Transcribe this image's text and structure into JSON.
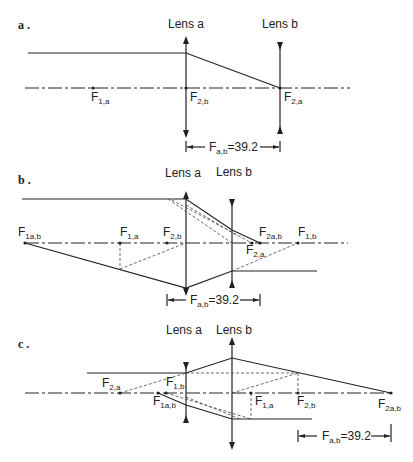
{
  "panels": {
    "a": {
      "label": "a .",
      "lens_a": "Lens a",
      "lens_b": "Lens b",
      "points": {
        "F1a": {
          "main": "F",
          "sub": "1,a"
        },
        "F2b": {
          "main": "F",
          "sub": "2,b"
        },
        "F2a": {
          "main": "F",
          "sub": "2,a"
        }
      },
      "dimension": {
        "main": "F",
        "sub": "a,b",
        "value": "=39.2"
      }
    },
    "b": {
      "label": "b .",
      "lens_a": "Lens a",
      "lens_b": "Lens b",
      "points": {
        "F1ab": {
          "main": "F",
          "sub": "1a,b"
        },
        "F1a": {
          "main": "F",
          "sub": "1,a"
        },
        "F2b": {
          "main": "F",
          "sub": "2,b"
        },
        "F2ab": {
          "main": "F",
          "sub": "2a,b"
        },
        "F2a": {
          "main": "F",
          "sub": "2,a"
        },
        "F1b": {
          "main": "F",
          "sub": "1,b"
        }
      },
      "dimension": {
        "main": "F",
        "sub": "a,b",
        "value": "=39.2"
      }
    },
    "c": {
      "label": "c .",
      "lens_a": "Lens a",
      "lens_b": "Lens b",
      "points": {
        "F2a": {
          "main": "F",
          "sub": "2,a"
        },
        "F1b": {
          "main": "F",
          "sub": "1,b"
        },
        "F1ab": {
          "main": "F",
          "sub": "1a,b"
        },
        "F1a": {
          "main": "F",
          "sub": "1,a"
        },
        "F2b": {
          "main": "F",
          "sub": "2,b"
        },
        "F2ab": {
          "main": "F",
          "sub": "2a,b"
        }
      },
      "dimension": {
        "main": "F",
        "sub": "a,b",
        "value": "=39.2"
      }
    }
  }
}
